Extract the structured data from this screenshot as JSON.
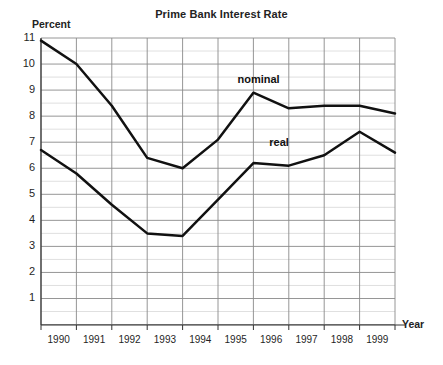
{
  "chart_data": {
    "type": "line",
    "title": "Prime Bank Interest Rate",
    "xlabel": "Year",
    "ylabel": "Percent",
    "x": [
      1989,
      1990,
      1991,
      1992,
      1993,
      1994,
      1995,
      1996,
      1997,
      1998,
      1999
    ],
    "xtick_labels": [
      "1990",
      "1991",
      "1992",
      "1993",
      "1994",
      "1995",
      "1996",
      "1997",
      "1998",
      "1999"
    ],
    "ytick_labels": [
      "11",
      "10",
      "9",
      "8",
      "7",
      "6",
      "5",
      "4",
      "3",
      "2",
      "1"
    ],
    "ylim": [
      0,
      11.5
    ],
    "xlim": [
      1989,
      1999
    ],
    "grid": true,
    "grid_minor_step": 0.5,
    "legend_position": "inline-annotations",
    "series": [
      {
        "name": "nominal",
        "label": "nominal",
        "values": [
          10.9,
          10.0,
          8.4,
          6.4,
          6.0,
          7.1,
          8.9,
          8.3,
          8.4,
          8.4,
          8.1
        ]
      },
      {
        "name": "real",
        "label": "real",
        "values": [
          6.7,
          5.8,
          4.6,
          3.5,
          3.4,
          4.8,
          6.2,
          6.1,
          6.5,
          7.4,
          6.6
        ]
      }
    ],
    "annotations": [
      {
        "text": "nominal",
        "x": 1994.55,
        "y": 9.35
      },
      {
        "text": "real",
        "x": 1995.45,
        "y": 6.95
      }
    ],
    "colors": {
      "line": "#111111",
      "grid_major": "#8a8a8a",
      "grid_minor": "#c9c9c9",
      "axis": "#333333",
      "background": "#ffffff"
    }
  }
}
